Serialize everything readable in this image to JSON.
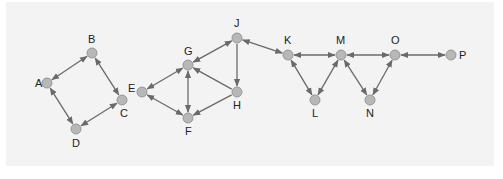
{
  "diagram": {
    "type": "directed-graph",
    "background": "#f3f3f3",
    "node_color": "#b8b8b8",
    "node_stroke": "#888888",
    "edge_color": "#6a6a6a",
    "nodes": [
      {
        "id": "A",
        "label": "A",
        "x": 47,
        "y": 83,
        "lx": -12,
        "ly": 4
      },
      {
        "id": "B",
        "label": "B",
        "x": 92,
        "y": 53,
        "lx": -4,
        "ly": -10
      },
      {
        "id": "C",
        "label": "C",
        "x": 122,
        "y": 100,
        "lx": -2,
        "ly": 17
      },
      {
        "id": "D",
        "label": "D",
        "x": 76,
        "y": 129,
        "lx": -4,
        "ly": 18
      },
      {
        "id": "E",
        "label": "E",
        "x": 142,
        "y": 92,
        "lx": -14,
        "ly": 0
      },
      {
        "id": "G",
        "label": "G",
        "x": 188,
        "y": 65,
        "lx": -4,
        "ly": -10
      },
      {
        "id": "F",
        "label": "F",
        "x": 188,
        "y": 118,
        "lx": -3,
        "ly": 17
      },
      {
        "id": "H",
        "label": "H",
        "x": 237,
        "y": 92,
        "lx": -4,
        "ly": 17
      },
      {
        "id": "J",
        "label": "J",
        "x": 237,
        "y": 38,
        "lx": -3,
        "ly": -11
      },
      {
        "id": "K",
        "label": "K",
        "x": 288,
        "y": 55,
        "lx": -4,
        "ly": -11
      },
      {
        "id": "L",
        "label": "L",
        "x": 315,
        "y": 100,
        "lx": -3,
        "ly": 17
      },
      {
        "id": "M",
        "label": "M",
        "x": 341,
        "y": 55,
        "lx": -5,
        "ly": -11
      },
      {
        "id": "N",
        "label": "N",
        "x": 370,
        "y": 100,
        "lx": -4,
        "ly": 17
      },
      {
        "id": "O",
        "label": "O",
        "x": 395,
        "y": 55,
        "lx": -4,
        "ly": -11
      },
      {
        "id": "P",
        "label": "P",
        "x": 451,
        "y": 55,
        "lx": 8,
        "ly": 4
      }
    ],
    "edges": [
      {
        "from": "A",
        "to": "B",
        "bidirectional": true
      },
      {
        "from": "A",
        "to": "D",
        "bidirectional": true
      },
      {
        "from": "B",
        "to": "C",
        "bidirectional": true
      },
      {
        "from": "C",
        "to": "D",
        "bidirectional": true
      },
      {
        "from": "E",
        "to": "G",
        "bidirectional": true
      },
      {
        "from": "E",
        "to": "F",
        "bidirectional": true
      },
      {
        "from": "G",
        "to": "F",
        "bidirectional": true
      },
      {
        "from": "H",
        "to": "G",
        "bidirectional": false
      },
      {
        "from": "H",
        "to": "F",
        "bidirectional": false
      },
      {
        "from": "J",
        "to": "G",
        "bidirectional": true
      },
      {
        "from": "J",
        "to": "H",
        "bidirectional": false
      },
      {
        "from": "K",
        "to": "J",
        "bidirectional": true
      },
      {
        "from": "K",
        "to": "M",
        "bidirectional": true
      },
      {
        "from": "K",
        "to": "L",
        "bidirectional": true
      },
      {
        "from": "L",
        "to": "M",
        "bidirectional": true
      },
      {
        "from": "M",
        "to": "O",
        "bidirectional": true
      },
      {
        "from": "M",
        "to": "N",
        "bidirectional": true
      },
      {
        "from": "N",
        "to": "O",
        "bidirectional": true
      },
      {
        "from": "O",
        "to": "P",
        "bidirectional": true
      }
    ]
  }
}
